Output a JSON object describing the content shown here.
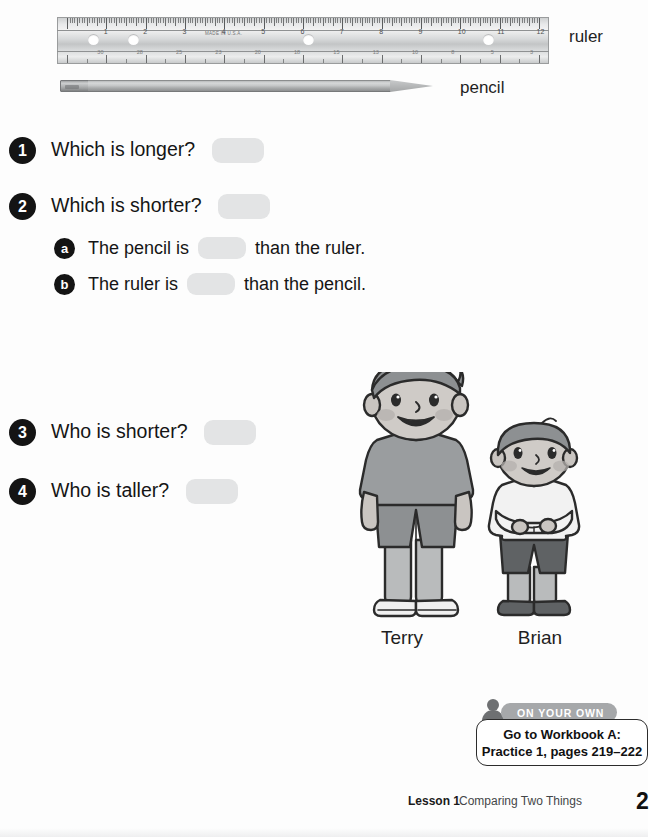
{
  "figures": {
    "ruler_label": "ruler",
    "pencil_label": "pencil",
    "ruler_brand": "MADE IN U.S.A.",
    "ruler_numbers": [
      "1",
      "2",
      "3",
      "4",
      "5",
      "6",
      "7",
      "8",
      "9",
      "10",
      "11",
      "12"
    ]
  },
  "questions": [
    {
      "number": "1",
      "text": "Which is longer?"
    },
    {
      "number": "2",
      "text": "Which is shorter?"
    },
    {
      "number": "3",
      "text": "Who is shorter?"
    },
    {
      "number": "4",
      "text": "Who is taller?"
    }
  ],
  "sub_questions": [
    {
      "mark": "a",
      "before": "The pencil is",
      "after": "than the ruler."
    },
    {
      "mark": "b",
      "before": "The ruler is",
      "after": "than the pencil."
    }
  ],
  "kids": {
    "taller_name": "Terry",
    "shorter_name": "Brian"
  },
  "on_your_own": {
    "badge": "ON YOUR OWN",
    "line1": "Go to Workbook A:",
    "line2": "Practice 1, pages 219–222"
  },
  "footer": {
    "lesson": "Lesson 1",
    "title": "Comparing Two Things",
    "page": "2"
  },
  "colors": {
    "blank_fill": "#e3e4e5",
    "marker_fill": "#141414",
    "badge_fill": "#a6a8aa",
    "text": "#151515"
  }
}
